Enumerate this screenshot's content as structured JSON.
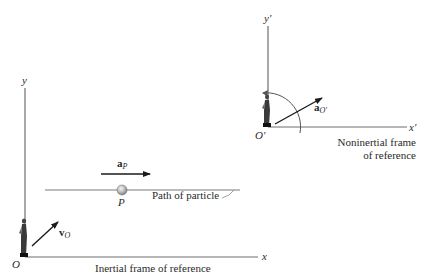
{
  "inertial_frame": {
    "origin_label": "O",
    "x_axis_label": "x",
    "y_axis_label": "y",
    "caption": "Inertial frame of reference",
    "velocity_vector": {
      "symbol": "v",
      "subscript": "O"
    }
  },
  "particle": {
    "label": "P",
    "path_label": "Path of particle",
    "acceleration_vector": {
      "symbol": "a",
      "subscript": "P"
    }
  },
  "noninertial_frame": {
    "origin_label": "O′",
    "x_axis_label": "x′",
    "y_axis_label": "y′",
    "caption_line1": "Noninertial frame",
    "caption_line2": "of reference",
    "acceleration_vector": {
      "symbol": "a",
      "subscript": "O′"
    }
  },
  "colors": {
    "axis": "#6e6e6e",
    "vector": "#1a1a1a",
    "text": "#2a2a2a",
    "particle": "#b8b8b8"
  }
}
